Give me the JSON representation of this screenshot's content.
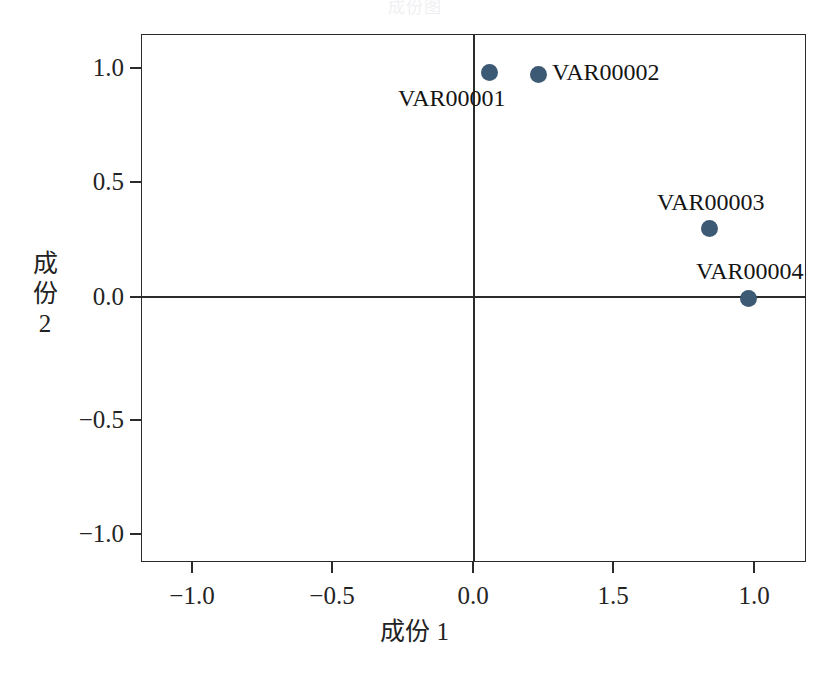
{
  "chart_data": {
    "type": "scatter",
    "title": "成份图",
    "xlabel": "成份 1",
    "ylabel": "成份 2",
    "xlim": [
      -1.18,
      1.18
    ],
    "ylim": [
      -1.15,
      1.15
    ],
    "grid": false,
    "legend": "none",
    "x_tick_labels": [
      "−1.0",
      "−0.5",
      "0.0",
      "1.5",
      "1.0"
    ],
    "x_tick_values": [
      -1.0,
      -0.5,
      0.0,
      0.5,
      1.0
    ],
    "y_tick_labels": [
      "1.0",
      "0.5",
      "0.0",
      "−0.5",
      "−1.0"
    ],
    "y_tick_values": [
      1.0,
      0.5,
      0.0,
      -0.5,
      -1.0
    ],
    "marker_color": "#3d5a75",
    "axis_color": "#2b2b2b",
    "background_color": "#ffffff",
    "points": [
      {
        "label": "VAR00001",
        "x": 0.04,
        "y": 0.96
      },
      {
        "label": "VAR00002",
        "x": 0.23,
        "y": 0.95
      },
      {
        "label": "VAR00003",
        "x": 0.84,
        "y": 0.3
      },
      {
        "label": "VAR00004",
        "x": 0.98,
        "y": 0.0
      }
    ]
  },
  "layout": {
    "plot": {
      "left": 141,
      "top": 34,
      "width": 665,
      "height": 528
    },
    "origin": {
      "x": 473,
      "y": 297
    },
    "x_tick_px": [
      192,
      332,
      473,
      613,
      754
    ],
    "y_tick_px": [
      68,
      182,
      297,
      420,
      534
    ],
    "markers_px": [
      {
        "x": 489,
        "y": 72
      },
      {
        "x": 538,
        "y": 74
      },
      {
        "x": 709,
        "y": 228
      },
      {
        "x": 748,
        "y": 298
      }
    ],
    "point_labels_px": [
      {
        "x": 398,
        "y": 86
      },
      {
        "x": 552,
        "y": 60
      },
      {
        "x": 657,
        "y": 190
      },
      {
        "x": 696,
        "y": 259
      }
    ]
  }
}
